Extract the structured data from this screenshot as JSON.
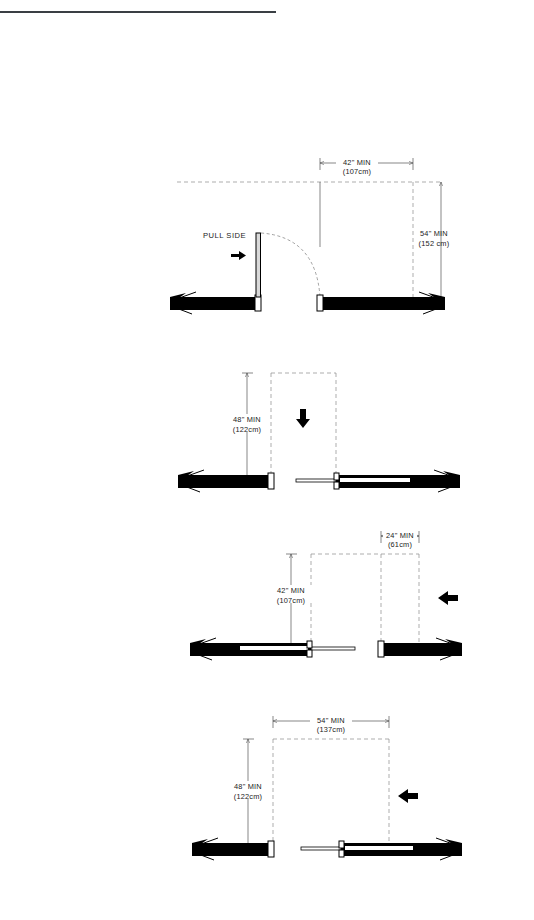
{
  "page": {
    "background_color": "#ffffff",
    "ink_color": "#000000",
    "dimension_line_color": "#555555"
  },
  "header_rule": {
    "name": "top-divider-rule",
    "color": "#3a3f44"
  },
  "figures": [
    {
      "id": "fig-1",
      "approach": "front-approach-pull-side",
      "side_label": "PULL SIDE",
      "approach_arrow": "arrow-right",
      "dimensions": [
        {
          "id": "fig1-horizontal",
          "orientation": "horizontal",
          "imperial": "42\" MIN",
          "metric": "(107cm)"
        },
        {
          "id": "fig1-vertical",
          "orientation": "vertical",
          "imperial": "54\" MIN",
          "metric": "(152 cm)"
        }
      ],
      "door_swing": true
    },
    {
      "id": "fig-2",
      "approach": "front-approach-push-side",
      "side_label": "",
      "approach_arrow": "arrow-down",
      "dimensions": [
        {
          "id": "fig2-vertical",
          "orientation": "vertical",
          "imperial": "48\" MIN",
          "metric": "(122cm)"
        }
      ],
      "door_swing": false
    },
    {
      "id": "fig-3",
      "approach": "hinge-side-approach",
      "side_label": "",
      "approach_arrow": "arrow-left",
      "dimensions": [
        {
          "id": "fig3-horizontal",
          "orientation": "horizontal",
          "imperial": "24\" MIN",
          "metric": "(61cm)"
        },
        {
          "id": "fig3-vertical",
          "orientation": "vertical",
          "imperial": "42\" MIN",
          "metric": "(107cm)"
        }
      ],
      "door_swing": false
    },
    {
      "id": "fig-4",
      "approach": "latch-side-approach",
      "side_label": "",
      "approach_arrow": "arrow-left",
      "dimensions": [
        {
          "id": "fig4-horizontal",
          "orientation": "horizontal",
          "imperial": "54\" MIN",
          "metric": "(137cm)"
        },
        {
          "id": "fig4-vertical",
          "orientation": "vertical",
          "imperial": "48\" MIN",
          "metric": "(122cm)"
        }
      ],
      "door_swing": false
    }
  ]
}
